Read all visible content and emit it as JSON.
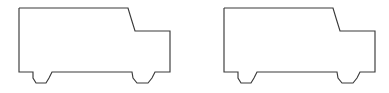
{
  "scene": {
    "title": "Two identical truck outline drawings",
    "background_color": "#ffffff",
    "width": 389,
    "height": 93,
    "stroke_color": "#3a3a3a",
    "stroke_width": 1.15,
    "fill": "none",
    "figure_count": 2,
    "figure_label": "truck-side-view-outline"
  },
  "figures": [
    {
      "name": "truck-left",
      "label": "Truck outline (left)",
      "origin_x": 19,
      "origin_y": 8,
      "bbox": {
        "x": 19,
        "y": 8,
        "width": 151,
        "height": 76
      },
      "points": "19,8 128,8 131,18 135,31 170,31 170,72 155,72 152,78 148,83 137,83 133,78 132,72 52,72 49,78 46,83 36,83 33,78 33,72 19,72 19,8"
    },
    {
      "name": "truck-right",
      "label": "Truck outline (right)",
      "origin_x": 224,
      "origin_y": 8,
      "bbox": {
        "x": 224,
        "y": 8,
        "width": 151,
        "height": 76
      },
      "points": "224,8 333,8 336,18 340,31 375,31 375,72 360,72 357,78 353,83 342,83 338,78 337,72 257,72 254,78 251,83 241,83 238,78 238,72 224,72 224,8"
    }
  ]
}
